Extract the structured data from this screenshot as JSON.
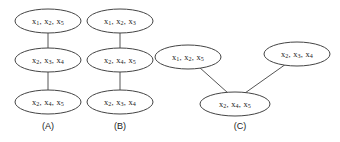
{
  "figure": {
    "type": "diagram",
    "background_color": "#ffffff",
    "node_fill": "#ffffff",
    "node_stroke": "#444444",
    "edge_color": "#555555",
    "text_color": "#1a1a1a"
  },
  "panels": [
    {
      "id": "A",
      "caption": "(A)",
      "caption_x": 48,
      "caption_y": 127,
      "layout": "vertical-chain",
      "nodes": [
        {
          "id": "a1",
          "cx": 48,
          "cy": 21,
          "rx": 33,
          "ry": 12,
          "items": [
            {
              "base": "x",
              "sub": "1"
            },
            {
              "base": "x",
              "sub": "2"
            },
            {
              "base": "x",
              "sub": "5"
            }
          ],
          "text": "x1, x2, x5"
        },
        {
          "id": "a2",
          "cx": 48,
          "cy": 60,
          "rx": 33,
          "ry": 12,
          "items": [
            {
              "base": "x",
              "sub": "2"
            },
            {
              "base": "x",
              "sub": "3"
            },
            {
              "base": "x",
              "sub": "4"
            }
          ],
          "text": "x2, x3, x4"
        },
        {
          "id": "a3",
          "cx": 48,
          "cy": 102,
          "rx": 33,
          "ry": 12,
          "items": [
            {
              "base": "x",
              "sub": "2"
            },
            {
              "base": "x",
              "sub": "4"
            },
            {
              "base": "x",
              "sub": "5"
            }
          ],
          "text": "x2, x4, x5"
        }
      ],
      "edges": [
        {
          "id": "a-e1",
          "from": "a1",
          "to": "a2",
          "x1": 48,
          "y1": 33,
          "x2": 48,
          "y2": 48
        },
        {
          "id": "a-e2",
          "from": "a2",
          "to": "a3",
          "x1": 48,
          "y1": 72,
          "x2": 48,
          "y2": 90
        }
      ]
    },
    {
      "id": "B",
      "caption": "(B)",
      "caption_x": 120,
      "caption_y": 127,
      "layout": "vertical-chain",
      "nodes": [
        {
          "id": "b1",
          "cx": 120,
          "cy": 21,
          "rx": 33,
          "ry": 12,
          "items": [
            {
              "base": "x",
              "sub": "1"
            },
            {
              "base": "x",
              "sub": "2"
            },
            {
              "base": "x",
              "sub": "3"
            }
          ],
          "text": "x1, x2, x3"
        },
        {
          "id": "b2",
          "cx": 120,
          "cy": 60,
          "rx": 33,
          "ry": 12,
          "items": [
            {
              "base": "x",
              "sub": "2"
            },
            {
              "base": "x",
              "sub": "4"
            },
            {
              "base": "x",
              "sub": "5"
            }
          ],
          "text": "x2, x4, x5"
        },
        {
          "id": "b3",
          "cx": 120,
          "cy": 102,
          "rx": 33,
          "ry": 12,
          "items": [
            {
              "base": "x",
              "sub": "2"
            },
            {
              "base": "x",
              "sub": "3"
            },
            {
              "base": "x",
              "sub": "4"
            }
          ],
          "text": "x2, x3, x4"
        }
      ],
      "edges": [
        {
          "id": "b-e1",
          "from": "b1",
          "to": "b2",
          "x1": 120,
          "y1": 33,
          "x2": 120,
          "y2": 48
        },
        {
          "id": "b-e2",
          "from": "b2",
          "to": "b3",
          "x1": 120,
          "y1": 72,
          "x2": 120,
          "y2": 90
        }
      ]
    },
    {
      "id": "C",
      "caption": "(C)",
      "caption_x": 240,
      "caption_y": 127,
      "layout": "v-shape",
      "nodes": [
        {
          "id": "c1",
          "cx": 188,
          "cy": 57,
          "rx": 33,
          "ry": 12,
          "items": [
            {
              "base": "x",
              "sub": "1"
            },
            {
              "base": "x",
              "sub": "2"
            },
            {
              "base": "x",
              "sub": "5"
            }
          ],
          "text": "x1, x2, x5"
        },
        {
          "id": "c2",
          "cx": 297,
          "cy": 54,
          "rx": 33,
          "ry": 12,
          "items": [
            {
              "base": "x",
              "sub": "2"
            },
            {
              "base": "x",
              "sub": "3"
            },
            {
              "base": "x",
              "sub": "4"
            }
          ],
          "text": "x2, x3, x4"
        },
        {
          "id": "c3",
          "cx": 235,
          "cy": 104,
          "rx": 35,
          "ry": 12,
          "items": [
            {
              "base": "x",
              "sub": "2"
            },
            {
              "base": "x",
              "sub": "4"
            },
            {
              "base": "x",
              "sub": "5"
            }
          ],
          "text": "x2, x4, x5"
        }
      ],
      "edges": [
        {
          "id": "c-e1",
          "from": "c1",
          "to": "c3",
          "x1": 199,
          "y1": 67,
          "x2": 228,
          "y2": 93
        },
        {
          "id": "c-e2",
          "from": "c2",
          "to": "c3",
          "x1": 286,
          "y1": 64,
          "x2": 245,
          "y2": 93
        }
      ]
    }
  ]
}
